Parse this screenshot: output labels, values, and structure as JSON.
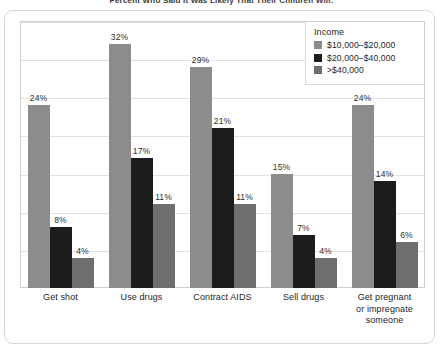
{
  "figure": {
    "title": "Percent Who Said It Was Likely That Their Children Will:"
  },
  "legend": {
    "title": "Income",
    "position": "top-right",
    "entries": [
      {
        "label": "$10,000–$20,000",
        "color": "#8c8c8c"
      },
      {
        "label": "$20,000–$40,000",
        "color": "#1c1c1c"
      },
      {
        "label": ">$40,000",
        "color": "#6e6e6e"
      }
    ]
  },
  "chart_data": {
    "type": "bar",
    "title": "Percent Who Said It Was Likely That Their Children Will:",
    "xlabel": "",
    "ylabel": "",
    "ylim": [
      0,
      35
    ],
    "grid": true,
    "grid_values": [
      0,
      5,
      10,
      15,
      20,
      25,
      30,
      35
    ],
    "legend_position": "top-right",
    "categories": [
      "Get shot",
      "Use drugs",
      "Contract AIDS",
      "Sell drugs",
      "Get pregnant or impregnate someone"
    ],
    "series": [
      {
        "name": "$10,000–$20,000",
        "color": "#8c8c8c",
        "values": [
          24,
          32,
          29,
          15,
          24
        ],
        "labels": [
          "24%",
          "32%",
          "29%",
          "15%",
          "24%"
        ]
      },
      {
        "name": "$20,000–$40,000",
        "color": "#1c1c1c",
        "values": [
          8,
          17,
          21,
          7,
          14
        ],
        "labels": [
          "8%",
          "17%",
          "21%",
          "7%",
          "14%"
        ]
      },
      {
        "name": ">$40,000",
        "color": "#6e6e6e",
        "values": [
          4,
          11,
          11,
          4,
          6
        ],
        "labels": [
          "4%",
          "11%",
          "11%",
          "4%",
          "6%"
        ]
      }
    ]
  },
  "xaxis": {
    "labels": [
      "Get shot",
      "Use drugs",
      "Contract AIDS",
      "Sell drugs",
      "Get pregnant\nor impregnate\nsomeone"
    ]
  }
}
